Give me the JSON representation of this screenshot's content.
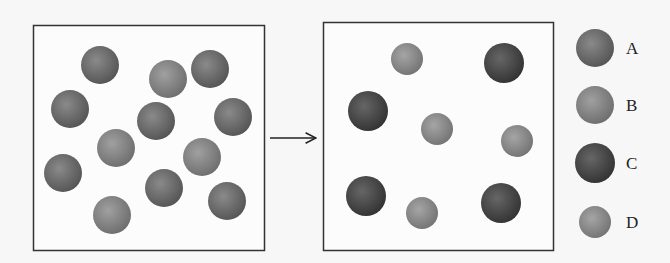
{
  "diagram": {
    "arrow": "reaction-arrow",
    "before_box": {
      "particles": [
        {
          "type": "A",
          "x": 100,
          "y": 65
        },
        {
          "type": "B",
          "x": 168,
          "y": 79
        },
        {
          "type": "A",
          "x": 210,
          "y": 69
        },
        {
          "type": "A",
          "x": 70,
          "y": 109
        },
        {
          "type": "A",
          "x": 156,
          "y": 121
        },
        {
          "type": "A",
          "x": 233,
          "y": 117
        },
        {
          "type": "B",
          "x": 116,
          "y": 148
        },
        {
          "type": "B",
          "x": 202,
          "y": 157
        },
        {
          "type": "A",
          "x": 63,
          "y": 173
        },
        {
          "type": "A",
          "x": 164,
          "y": 188
        },
        {
          "type": "A",
          "x": 227,
          "y": 201
        },
        {
          "type": "B",
          "x": 112,
          "y": 215
        }
      ]
    },
    "after_box": {
      "particles": [
        {
          "type": "D",
          "x": 407,
          "y": 59
        },
        {
          "type": "C",
          "x": 504,
          "y": 63
        },
        {
          "type": "C",
          "x": 368,
          "y": 111
        },
        {
          "type": "D",
          "x": 437,
          "y": 129
        },
        {
          "type": "D",
          "x": 517,
          "y": 141
        },
        {
          "type": "C",
          "x": 366,
          "y": 196
        },
        {
          "type": "D",
          "x": 422,
          "y": 213
        },
        {
          "type": "C",
          "x": 501,
          "y": 203
        }
      ]
    },
    "legend": [
      {
        "label": "A",
        "type": "A"
      },
      {
        "label": "B",
        "type": "B"
      },
      {
        "label": "C",
        "type": "C"
      },
      {
        "label": "D",
        "type": "D"
      }
    ],
    "colors": {
      "A": "#6b6b6b",
      "B": "#858585",
      "C": "#4a4a4a",
      "D": "#8a8a8a"
    }
  }
}
